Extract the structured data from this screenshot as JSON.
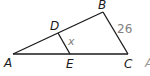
{
  "figure": {
    "type": "triangle-with-parallel-segment",
    "vertices": {
      "A": {
        "label": "A"
      },
      "B": {
        "label": "B"
      },
      "C": {
        "label": "C"
      },
      "D": {
        "label": "D"
      },
      "E": {
        "label": "E"
      }
    },
    "segments": {
      "BC": {
        "measure": "26"
      },
      "DE": {
        "measure": "x"
      }
    },
    "cutoff_label": "A"
  }
}
